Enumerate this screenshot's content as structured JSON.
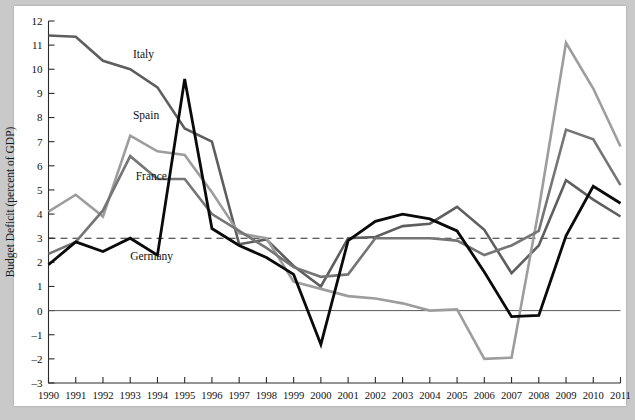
{
  "chart_data": {
    "type": "line",
    "title": "",
    "subtitle": "",
    "xlabel": "",
    "ylabel": "Budget Deficit (percent of GDP)",
    "x": [
      1990,
      1991,
      1992,
      1993,
      1994,
      1995,
      1996,
      1997,
      1998,
      1999,
      2000,
      2001,
      2002,
      2003,
      2004,
      2005,
      2006,
      2007,
      2008,
      2009,
      2010,
      2011
    ],
    "xticklabels": [
      "1990",
      "1991",
      "1992",
      "1993",
      "1994",
      "1995",
      "1996",
      "1997",
      "1998",
      "1999",
      "2000",
      "2001",
      "2002",
      "2003",
      "2004",
      "2005",
      "2006",
      "2007",
      "2008",
      "2009",
      "2010",
      "2011"
    ],
    "yticklabels": [
      "12",
      "11",
      "10",
      "9",
      "8",
      "7",
      "6",
      "5",
      "4",
      "3",
      "2",
      "1",
      "0",
      "–1",
      "–2",
      "–3"
    ],
    "yticks": [
      12,
      11,
      10,
      9,
      8,
      7,
      6,
      5,
      4,
      3,
      2,
      1,
      0,
      -1,
      -2,
      -3
    ],
    "ylim": [
      -3,
      12
    ],
    "xlim": [
      1990,
      2011
    ],
    "grid": false,
    "legend_position": "inline-annotations",
    "zero_line": 0,
    "reference_line": {
      "value": 3,
      "style": "dashed",
      "label": ""
    },
    "series": [
      {
        "name": "Italy",
        "color": "#5e5e5e",
        "width": 2.6,
        "label_x": 1993.1,
        "label_y": 10.45,
        "values": [
          11.4,
          11.35,
          10.35,
          10.0,
          9.25,
          7.55,
          7.0,
          2.75,
          2.95,
          1.85,
          1.0,
          3.0,
          3.05,
          3.5,
          3.6,
          4.3,
          3.35,
          1.55,
          2.7,
          5.4,
          4.6,
          3.9
        ]
      },
      {
        "name": "Spain",
        "color": "#9d9d9d",
        "width": 2.6,
        "label_x": 1993.1,
        "label_y": 7.95,
        "values": [
          4.1,
          4.8,
          3.9,
          7.25,
          6.6,
          6.45,
          4.9,
          3.2,
          3.0,
          1.2,
          0.9,
          0.6,
          0.5,
          0.3,
          0.0,
          0.05,
          -2.0,
          -1.95,
          4.2,
          11.1,
          9.2,
          6.8
        ]
      },
      {
        "name": "France",
        "color": "#757575",
        "width": 2.6,
        "label_x": 1993.2,
        "label_y": 5.4,
        "values": [
          2.35,
          2.85,
          4.15,
          6.4,
          5.45,
          5.45,
          4.0,
          3.3,
          2.6,
          1.8,
          1.4,
          1.5,
          3.0,
          3.0,
          3.0,
          2.9,
          2.3,
          2.7,
          3.3,
          7.5,
          7.1,
          5.2
        ]
      },
      {
        "name": "Germany",
        "color": "#0a0a0a",
        "width": 2.8,
        "label_x": 1993.0,
        "label_y": 2.1,
        "values": [
          1.9,
          2.85,
          2.45,
          3.0,
          2.3,
          9.6,
          3.4,
          2.7,
          2.2,
          1.5,
          -1.4,
          2.9,
          3.7,
          4.0,
          3.8,
          3.3,
          1.6,
          -0.25,
          -0.2,
          3.1,
          5.15,
          4.45
        ]
      }
    ]
  }
}
